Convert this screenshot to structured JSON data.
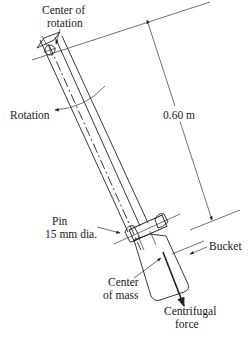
{
  "figure": {
    "type": "centrifuge swing-arm diagram",
    "colors": {
      "background": "#ffffff",
      "ink": "#222222"
    },
    "labels": {
      "center_of_rotation_line1": "Center of",
      "center_of_rotation_line2": "rotation",
      "rotation": "Rotation",
      "length": "0.60 m",
      "pin_line1": "Pin",
      "pin_line2": "15 mm dia.",
      "bucket": "Bucket",
      "center_of_mass_line1": "Center",
      "center_of_mass_line2": "of mass",
      "centrifugal_force_line1": "Centrifugal",
      "centrifugal_force_line2": "force"
    }
  }
}
